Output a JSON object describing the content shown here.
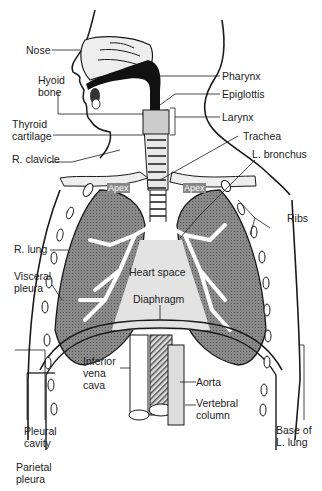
{
  "diagram": {
    "labels": {
      "nose": "Nose",
      "hyoid_bone_1": "Hyoid",
      "hyoid_bone_2": "bone",
      "thyroid_cartilage_1": "Thyroid",
      "thyroid_cartilage_2": "cartilage",
      "r_clavicle": "R. clavicle",
      "pharynx": "Pharynx",
      "epiglottis": "Epiglottis",
      "larynx": "Larynx",
      "trachea": "Trachea",
      "l_bronchus": "L. bronchus",
      "apex_right": "Apex",
      "apex_left": "Apex",
      "ribs": "Ribs",
      "r_lung": "R. lung",
      "visceral_pleura_1": "Visceral",
      "visceral_pleura_2": "pleura",
      "heart_space": "Heart space",
      "diaphragm": "Diaphragm",
      "inferior_vena_cava_1": "Inferior",
      "inferior_vena_cava_2": "vena",
      "inferior_vena_cava_3": "cava",
      "aorta": "Aorta",
      "vertebral_column_1": "Vertebral",
      "vertebral_column_2": "column",
      "pleural_cavity_1": "Pleural",
      "pleural_cavity_2": "cavity",
      "parietal_pleura_1": "Parietal",
      "parietal_pleura_2": "pleura",
      "base_l_lung_1": "Base of",
      "base_l_lung_2": "L. lung"
    },
    "colors": {
      "ink": "#1a1a1a",
      "lung": "#7a7a7a",
      "pale": "#d9d9d9"
    }
  }
}
